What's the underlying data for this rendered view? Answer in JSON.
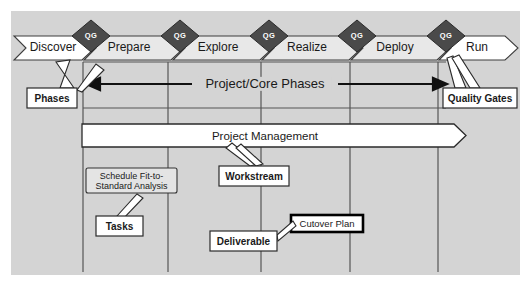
{
  "diagram": {
    "background_color": "#d4d4d4",
    "phase_fill_color": "#e8e8e8",
    "phase_edge_color": "#ffffff",
    "gate_fill_color": "#4a4a4a",
    "line_color": "#555555"
  },
  "phases": [
    {
      "label": "Discover",
      "fill": "#ffffff",
      "cx": 53
    },
    {
      "label": "Prepare",
      "fill": "#e8e8e8",
      "cx": 127
    },
    {
      "label": "Explore",
      "fill": "#e8e8e8",
      "cx": 216
    },
    {
      "label": "Realize",
      "fill": "#e8e8e8",
      "cx": 305
    },
    {
      "label": "Deploy",
      "fill": "#e8e8e8",
      "cx": 393
    },
    {
      "label": "Run",
      "fill": "#ffffff",
      "cx": 473
    }
  ],
  "quality_gates": [
    {
      "label": "QG",
      "cx": 91
    },
    {
      "label": "QG",
      "cx": 180
    },
    {
      "label": "QG",
      "cx": 269
    },
    {
      "label": "QG",
      "cx": 357
    },
    {
      "label": "QG",
      "cx": 446
    }
  ],
  "core_phase_band": {
    "label": "Project/Core Phases",
    "arrow_from_x": 86,
    "arrow_to_x": 447,
    "y": 84
  },
  "workstream_bar": {
    "label": "Project Management",
    "x": 82,
    "y": 124,
    "width": 384,
    "height": 23
  },
  "task_box": {
    "label": "Schedule Fit-to-Standard Analysis",
    "x": 86,
    "y": 168,
    "width": 91,
    "height": 25
  },
  "deliverable_box": {
    "label": "Cutover Plan",
    "x": 291,
    "y": 215,
    "width": 72,
    "height": 17
  },
  "callouts": [
    {
      "name": "phases",
      "label": "Phases",
      "x": 27,
      "y": 88,
      "width": 50,
      "height": 20
    },
    {
      "name": "quality-gates",
      "label": "Quality Gates",
      "x": 443,
      "y": 88,
      "width": 74,
      "height": 20
    },
    {
      "name": "workstream",
      "label": "Workstream",
      "x": 219,
      "y": 166,
      "width": 70,
      "height": 20
    },
    {
      "name": "tasks",
      "label": "Tasks",
      "x": 96,
      "y": 216,
      "width": 47,
      "height": 20
    },
    {
      "name": "deliverable",
      "label": "Deliverable",
      "x": 210,
      "y": 231,
      "width": 67,
      "height": 20
    }
  ],
  "dividers": [
    {
      "x": 83
    },
    {
      "x": 168
    },
    {
      "x": 261
    },
    {
      "x": 350
    },
    {
      "x": 438
    }
  ]
}
